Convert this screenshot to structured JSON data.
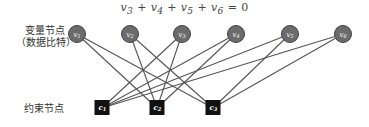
{
  "formula": {
    "terms": [
      {
        "base": "v",
        "sub": "3"
      },
      {
        "base": "v",
        "sub": "4"
      },
      {
        "base": "v",
        "sub": "5"
      },
      {
        "base": "v",
        "sub": "6"
      }
    ],
    "operator": "+",
    "equals": "=",
    "rhs": "0"
  },
  "labels": {
    "variable_nodes_line1": "变量节点",
    "variable_nodes_line2": "（数据比特）",
    "constraint_nodes": "约束节点"
  },
  "colors": {
    "variable_fill": "#6b6b6b",
    "variable_stroke": "#444444",
    "constraint_fill": "#111111",
    "edge": "#555555"
  },
  "variable_nodes": [
    {
      "id": "v1",
      "base": "v",
      "sub": "1",
      "x": 77,
      "y": 34
    },
    {
      "id": "v2",
      "base": "v",
      "sub": "2",
      "x": 130,
      "y": 34
    },
    {
      "id": "v3",
      "base": "v",
      "sub": "3",
      "x": 182,
      "y": 34
    },
    {
      "id": "v4",
      "base": "v",
      "sub": "4",
      "x": 236,
      "y": 34
    },
    {
      "id": "v5",
      "base": "v",
      "sub": "5",
      "x": 290,
      "y": 34
    },
    {
      "id": "v6",
      "base": "v",
      "sub": "6",
      "x": 343,
      "y": 34
    }
  ],
  "constraint_nodes": [
    {
      "id": "c1",
      "base": "c",
      "sub": "1",
      "x": 102,
      "y": 108
    },
    {
      "id": "c2",
      "base": "c",
      "sub": "2",
      "x": 157,
      "y": 108
    },
    {
      "id": "c3",
      "base": "c",
      "sub": "3",
      "x": 213,
      "y": 108
    }
  ],
  "edges": [
    [
      "v3",
      "c1"
    ],
    [
      "v4",
      "c1"
    ],
    [
      "v5",
      "c1"
    ],
    [
      "v6",
      "c1"
    ],
    [
      "v1",
      "c2"
    ],
    [
      "v2",
      "c2"
    ],
    [
      "v3",
      "c2"
    ],
    [
      "v4",
      "c2"
    ],
    [
      "v1",
      "c3"
    ],
    [
      "v2",
      "c3"
    ],
    [
      "v5",
      "c3"
    ],
    [
      "v6",
      "c3"
    ]
  ]
}
